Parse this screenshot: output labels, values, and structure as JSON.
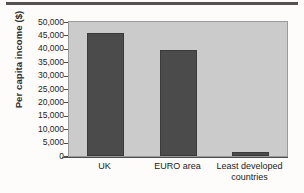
{
  "chart_data": {
    "type": "bar",
    "title": "",
    "subtitle": "",
    "xlabel": "",
    "ylabel": "Per capita income ($)",
    "categories": [
      "UK",
      "EURO area",
      "Least developed countries"
    ],
    "category_lines": [
      [
        "UK"
      ],
      [
        "EURO area"
      ],
      [
        "Least developed",
        "countries"
      ]
    ],
    "values": [
      45800,
      39500,
      1500
    ],
    "series": [
      {
        "name": "Per capita income",
        "values": [
          45800,
          39500,
          1500
        ]
      }
    ],
    "ylim": [
      0,
      50000
    ],
    "ytick_values": [
      50000,
      45000,
      40000,
      35000,
      30000,
      25000,
      20000,
      15000,
      10000,
      5000,
      0
    ],
    "ytick_labels": [
      "50,000",
      "45,000",
      "40,000",
      "35,000",
      "30,000",
      "25,000",
      "20,000",
      "15,000",
      "10,000",
      "5,000",
      "0"
    ],
    "grid": false,
    "legend": "none",
    "legend_position": "none",
    "bar_color": "#4b4b4b",
    "plot_background": "#cbcbcb",
    "figure_background": "#fdfcfa",
    "axis_color": "#4d4d4d"
  }
}
